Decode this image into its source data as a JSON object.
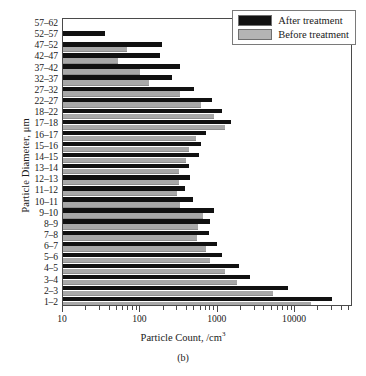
{
  "figure": {
    "caption": "(b)",
    "xtitle_main": "Particle Count, /cm",
    "xtitle_sup": "3",
    "ylabel": "Particle Diameter, μm"
  },
  "legend": {
    "position": "top-right",
    "items": [
      {
        "label": "After treatment",
        "color": "#111111",
        "key": "after"
      },
      {
        "label": "Before treatment",
        "color": "#b4b4b4",
        "key": "before"
      }
    ]
  },
  "chart_data": {
    "type": "bar",
    "orientation": "horizontal",
    "title": "",
    "xlabel": "Particle Count, /cm3",
    "ylabel": "Particle Diameter, μm",
    "xscale": "log",
    "xlim": [
      10,
      56000
    ],
    "xticks": [
      10,
      100,
      1000,
      10000
    ],
    "xticklabels": [
      "10",
      "100",
      "1000",
      "10000"
    ],
    "grid": false,
    "legend_position": "top right",
    "categories": [
      "57–62",
      "52–57",
      "47–52",
      "42–47",
      "37–42",
      "32–37",
      "27–32",
      "22–27",
      "18–22",
      "17–18",
      "16–17",
      "15–16",
      "14–15",
      "13–14",
      "12–13",
      "11–12",
      "10–11",
      "9–10",
      "8–9",
      "7–8",
      "6–7",
      "5–6",
      "4–5",
      "3–4",
      "2–3",
      "1–2"
    ],
    "series": [
      {
        "name": "After treatment",
        "color": "#111111",
        "values": [
          0,
          35,
          190,
          180,
          330,
          260,
          500,
          840,
          1150,
          1500,
          700,
          610,
          570,
          430,
          440,
          380,
          480,
          900,
          800,
          760,
          980,
          1150,
          1900,
          2600,
          8000,
          30000
        ]
      },
      {
        "name": "Before treatment",
        "color": "#b4b4b4",
        "values": [
          0,
          0,
          68,
          52,
          100,
          130,
          330,
          600,
          900,
          1250,
          530,
          430,
          390,
          320,
          320,
          300,
          330,
          640,
          560,
          540,
          700,
          800,
          1250,
          1800,
          5200,
          16000
        ]
      }
    ]
  }
}
